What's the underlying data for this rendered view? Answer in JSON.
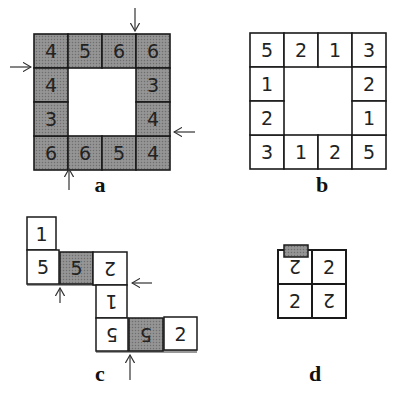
{
  "colors": {
    "shaded_fill": "#8a8a8a",
    "plain_fill": "#ffffff",
    "stroke": "#1a1a1a",
    "tab_fill": "#9a9a9a"
  },
  "panels": [
    {
      "id": "a",
      "label": "a",
      "shaded": true,
      "ring": {
        "top": [
          "4",
          "5",
          "6",
          "6"
        ],
        "right": [
          "3",
          "4"
        ],
        "bottom": [
          "6",
          "6",
          "5",
          "4"
        ],
        "left": [
          "4",
          "3"
        ]
      },
      "arrows": [
        "top",
        "left",
        "right",
        "bottom"
      ]
    },
    {
      "id": "b",
      "label": "b",
      "shaded": false,
      "ring": {
        "top": [
          "5",
          "2",
          "1",
          "3"
        ],
        "right": [
          "2",
          "1"
        ],
        "bottom": [
          "3",
          "1",
          "2",
          "5"
        ],
        "left": [
          "1",
          "2"
        ]
      }
    },
    {
      "id": "c",
      "label": "c",
      "tiles": [
        {
          "value": "1",
          "flipped": false,
          "shaded": false
        },
        {
          "value": "5",
          "flipped": false,
          "shaded": false
        },
        {
          "value": "5",
          "flipped": false,
          "shaded": true
        },
        {
          "value": "2",
          "flipped": true,
          "shaded": false
        },
        {
          "value": "1",
          "flipped": true,
          "shaded": false
        },
        {
          "value": "5",
          "flipped": true,
          "shaded": false
        },
        {
          "value": "5",
          "flipped": true,
          "shaded": true
        },
        {
          "value": "2",
          "flipped": false,
          "shaded": false
        }
      ]
    },
    {
      "id": "d",
      "label": "d",
      "tiles": [
        {
          "value": "2",
          "flipped": true
        },
        {
          "value": "2",
          "flipped": false
        },
        {
          "value": "2",
          "flipped": false
        },
        {
          "value": "2",
          "flipped": true
        }
      ]
    }
  ]
}
